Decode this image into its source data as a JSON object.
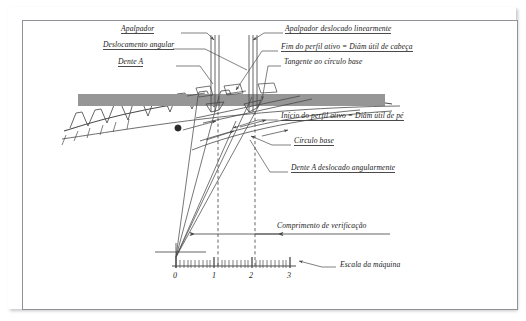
{
  "figure": {
    "title_language": "pt-BR"
  },
  "labels": {
    "apalpador": "Apalpador",
    "deslocamento_angular": "Deslocamento angular",
    "dente_a": "Dente A",
    "apalpador_deslocado": "Apalpador deslocado linearmente",
    "fim_perfil_ativo": "Fim do perfil ativo = Diâm útil de cabeça",
    "tangente_circulo_base": "Tangente ao círculo base",
    "inicio_perfil_ativo": "Início do perfil ativo = Diâm útil de pé",
    "circulo_base": "Círculo base",
    "dente_a_deslocado": "Dente A deslocado angularmente",
    "comprimento_verificacao": "Comprimento de verificação",
    "escala_maquina": "Escala da máquina"
  },
  "scale": {
    "ticks": [
      "0",
      "1",
      "2",
      "3"
    ],
    "major_tick_count": 4,
    "minor_per_major": 10
  },
  "colors": {
    "line": "#4a4a4a",
    "band": "#969696",
    "border": "#8f9296",
    "text": "#1b1b1b",
    "background": "#ffffff"
  }
}
